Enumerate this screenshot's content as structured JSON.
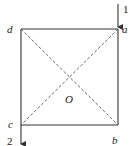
{
  "diagram": {
    "type": "square-loop-with-diagonals",
    "colors": {
      "stroke": "#333333",
      "dashed": "#555555",
      "text": "#222222",
      "background": "#ffffff"
    },
    "vertices": {
      "a": {
        "label": "a",
        "position": "top-right"
      },
      "b": {
        "label": "b",
        "position": "bottom-right"
      },
      "c": {
        "label": "c",
        "position": "bottom-left"
      },
      "d": {
        "label": "d",
        "position": "top-left"
      }
    },
    "center": {
      "label": "O"
    },
    "terminals": [
      {
        "id": "1",
        "label": "1",
        "direction": "in",
        "attached_to": "a"
      },
      {
        "id": "2",
        "label": "2",
        "direction": "out",
        "attached_to": "c"
      }
    ],
    "edges_solid": [
      "a-b",
      "b-c",
      "c-d",
      "d-a"
    ],
    "edges_dashed": [
      "a-c",
      "b-d"
    ]
  }
}
